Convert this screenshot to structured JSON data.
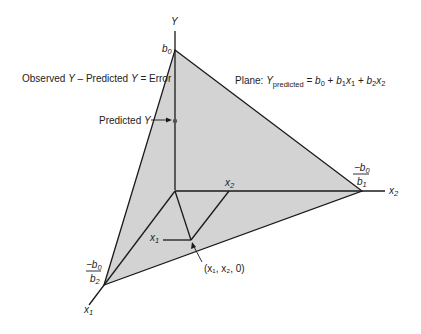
{
  "diagram": {
    "axes": {
      "y_label": "Y",
      "x2_label": "x",
      "x2_sub": "2",
      "x1_label": "x",
      "x1_sub": "1"
    },
    "intercepts": {
      "b0_label": "b",
      "b0_sub": "0",
      "x2_intercept_num": "−b",
      "x2_intercept_num_sub": "0",
      "x2_intercept_den": "b",
      "x2_intercept_den_sub": "1",
      "x1_intercept_num": "−b",
      "x1_intercept_num_sub": "0",
      "x1_intercept_den": "b",
      "x1_intercept_den_sub": "2"
    },
    "annotations": {
      "error_text_a": "Observed ",
      "error_text_b": "Y",
      "error_text_c": " – Predicted ",
      "error_text_d": "Y",
      "error_text_e": " = Error",
      "predicted_a": "Predicted ",
      "predicted_b": "Y",
      "plane_prefix": "Plane: ",
      "plane_Y": "Y",
      "plane_Y_sub": "predicted",
      "plane_eq_1": " = ",
      "plane_b0": "b",
      "plane_b0_sub": "0",
      "plane_plus1": " + ",
      "plane_b1": "b",
      "plane_b1_sub": "1",
      "plane_x1": "x",
      "plane_x1_sub": "1",
      "plane_plus2": " + ",
      "plane_b2": "b",
      "plane_b2_sub": "2",
      "plane_x2": "x",
      "plane_x2_sub": "2",
      "point_label": "(x₁, x₂, 0)",
      "x1_point_label": "x",
      "x1_point_sub": "1",
      "x2_point_label": "x",
      "x2_point_sub": "2"
    },
    "colors": {
      "plane_fill": "#d3d3d3",
      "line": "#1a1a1a",
      "text": "#222222"
    }
  }
}
